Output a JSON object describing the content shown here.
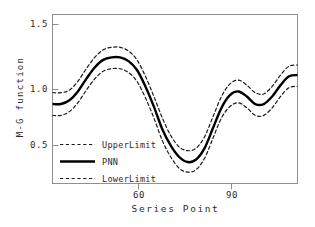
{
  "chart_data": {
    "type": "line",
    "title": "",
    "xlabel": "Series Point",
    "ylabel": "M-G function",
    "xlim": [
      47,
      105
    ],
    "ylim": [
      0.28,
      1.62
    ],
    "xticks": [
      60,
      90
    ],
    "yticks": [
      0.5,
      1.0,
      1.5
    ],
    "xtick_labels": [
      "60",
      "90"
    ],
    "ytick_labels": [
      "0.5",
      "1.0",
      "1.5"
    ],
    "grid": false,
    "legend_position": "lower-left-inside",
    "series": [
      {
        "name": "UpperLimit",
        "style": "dashed",
        "color": "#1a1a1a",
        "x": [
          47,
          49,
          51,
          53,
          55,
          57,
          59,
          61,
          63,
          65,
          67,
          69,
          71,
          73,
          75,
          77,
          79,
          81,
          83,
          85,
          87,
          89,
          91,
          93,
          95,
          97,
          99,
          101,
          103,
          105
        ],
        "values": [
          1.0,
          1.0,
          1.02,
          1.09,
          1.19,
          1.28,
          1.34,
          1.36,
          1.36,
          1.33,
          1.26,
          1.13,
          0.97,
          0.8,
          0.66,
          0.57,
          0.54,
          0.56,
          0.65,
          0.81,
          0.97,
          1.07,
          1.1,
          1.06,
          1.0,
          0.99,
          1.05,
          1.14,
          1.21,
          1.22
        ]
      },
      {
        "name": "PNN",
        "style": "solid",
        "color": "#000000",
        "x": [
          47,
          49,
          51,
          53,
          55,
          57,
          59,
          61,
          63,
          65,
          67,
          69,
          71,
          73,
          75,
          77,
          79,
          81,
          83,
          85,
          87,
          89,
          91,
          93,
          95,
          97,
          99,
          101,
          103,
          105
        ],
        "values": [
          0.91,
          0.91,
          0.94,
          1.01,
          1.11,
          1.2,
          1.26,
          1.28,
          1.28,
          1.25,
          1.18,
          1.05,
          0.89,
          0.71,
          0.58,
          0.49,
          0.45,
          0.47,
          0.56,
          0.72,
          0.88,
          0.98,
          1.01,
          0.97,
          0.91,
          0.91,
          0.97,
          1.06,
          1.13,
          1.14
        ]
      },
      {
        "name": "LowerLimit",
        "style": "dashed",
        "color": "#1a1a1a",
        "x": [
          47,
          49,
          51,
          53,
          55,
          57,
          59,
          61,
          63,
          65,
          67,
          69,
          71,
          73,
          75,
          77,
          79,
          81,
          83,
          85,
          87,
          89,
          91,
          93,
          95,
          97,
          99,
          101,
          103,
          105
        ],
        "values": [
          0.82,
          0.82,
          0.85,
          0.92,
          1.02,
          1.11,
          1.17,
          1.19,
          1.19,
          1.16,
          1.09,
          0.96,
          0.8,
          0.62,
          0.49,
          0.4,
          0.37,
          0.39,
          0.48,
          0.64,
          0.8,
          0.89,
          0.92,
          0.88,
          0.82,
          0.82,
          0.88,
          0.97,
          1.04,
          1.05
        ]
      }
    ],
    "legend_entries": [
      {
        "label": "UpperLimit",
        "style": "dashed"
      },
      {
        "label": "PNN",
        "style": "solid"
      },
      {
        "label": "LowerLimit",
        "style": "dashed"
      }
    ]
  },
  "axis": {
    "y_title": "M-G function",
    "x_title": "Series Point",
    "ytick_0": "1.5",
    "ytick_1": "1.0",
    "ytick_2": "0.5",
    "xtick_0": "60",
    "xtick_1": "90"
  },
  "legend": {
    "item_0": "UpperLimit",
    "item_1": "PNN",
    "item_2": "LowerLimit"
  },
  "colors": {
    "frame": "#8a8a8a",
    "line": "#000000",
    "text": "#2b2b2b",
    "background": "#ffffff"
  }
}
